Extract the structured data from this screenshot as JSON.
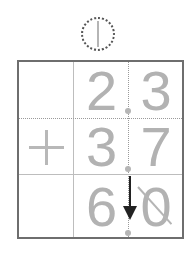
{
  "carry": {
    "digit": "1",
    "style": "dotted-circle"
  },
  "grid": {
    "rows": [
      {
        "operator": "",
        "ones": "2",
        "tenths": "3"
      },
      {
        "operator": "+",
        "ones": "3",
        "tenths": "7"
      },
      {
        "operator": "",
        "ones": "6",
        "tenths": "0",
        "tenths_crossed_out": true
      }
    ],
    "decimal_point": "."
  },
  "annotations": {
    "arrow": "decimal point brought down to result"
  },
  "colors": {
    "digits": "#b2b2b2",
    "border": "#6e6e6e",
    "arrow": "#222222",
    "carry_circle": "#555555"
  }
}
